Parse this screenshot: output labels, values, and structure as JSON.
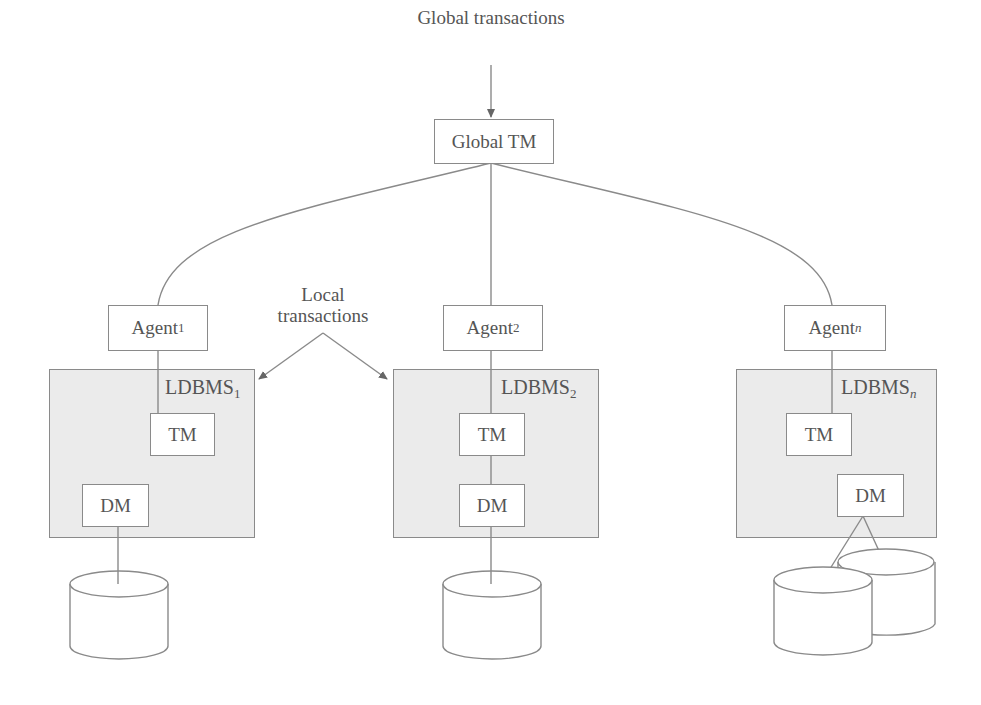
{
  "diagram": {
    "top_label": "Global transactions",
    "global_tm": "Global TM",
    "local_label_line1": "Local",
    "local_label_line2": "transactions",
    "sites": [
      {
        "agent": "Agent",
        "agent_sub": "1",
        "ldbms": "LDBMS",
        "ldbms_sub": "1",
        "tm": "TM",
        "dm": "DM",
        "databases": 1
      },
      {
        "agent": "Agent",
        "agent_sub": "2",
        "ldbms": "LDBMS",
        "ldbms_sub": "2",
        "tm": "TM",
        "dm": "DM",
        "databases": 1
      },
      {
        "agent": "Agent",
        "agent_sub": "n",
        "ldbms": "LDBMS",
        "ldbms_sub": "n",
        "tm": "TM",
        "dm": "DM",
        "databases": 2
      }
    ],
    "colors": {
      "line": "#8a8a8a",
      "panel_fill": "#ebebeb",
      "text": "#555555"
    }
  }
}
